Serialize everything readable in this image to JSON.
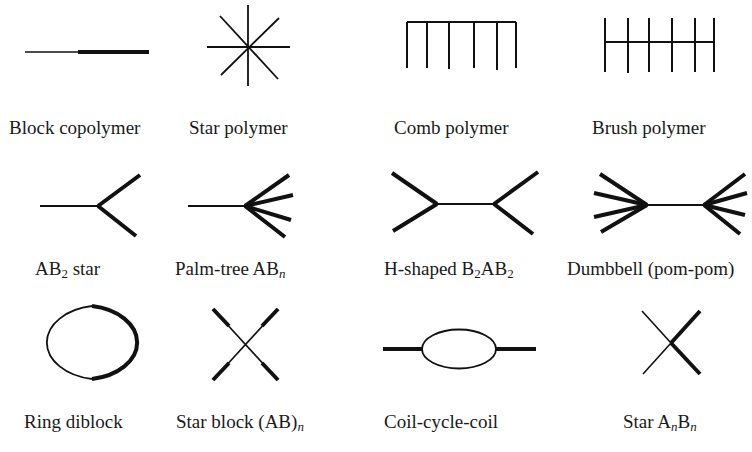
{
  "diagram": {
    "colors": {
      "stroke": "#111111",
      "background": "#ffffff"
    },
    "items": [
      {
        "id": "block-copolymer",
        "label": "Block copolymer",
        "row": 1,
        "col": 1
      },
      {
        "id": "star-polymer",
        "label": "Star polymer",
        "row": 1,
        "col": 2
      },
      {
        "id": "comb-polymer",
        "label": "Comb polymer",
        "row": 1,
        "col": 3
      },
      {
        "id": "brush-polymer",
        "label": "Brush polymer",
        "row": 1,
        "col": 4
      },
      {
        "id": "ab2-star",
        "label_main": "AB",
        "label_sub": "2",
        "label_tail": " star",
        "row": 2,
        "col": 1
      },
      {
        "id": "palm-tree",
        "label_main": "Palm-tree AB",
        "label_sub": "n",
        "row": 2,
        "col": 2
      },
      {
        "id": "h-shaped",
        "label_main": "H-shaped B",
        "label_sub": "2",
        "label_mid": "AB",
        "label_sub2": "2",
        "row": 2,
        "col": 3
      },
      {
        "id": "dumbbell",
        "label": "Dumbbell (pom-pom)",
        "row": 2,
        "col": 4
      },
      {
        "id": "ring-diblock",
        "label": "Ring diblock",
        "row": 3,
        "col": 1
      },
      {
        "id": "star-block",
        "label_main": "Star block (AB)",
        "label_sub": "n",
        "row": 3,
        "col": 2
      },
      {
        "id": "coil-cycle-coil",
        "label": "Coil-cycle-coil",
        "row": 3,
        "col": 3
      },
      {
        "id": "star-anbn",
        "label_main": "Star A",
        "label_sub": "n",
        "label_mid": "B",
        "label_sub2": "n",
        "row": 3,
        "col": 4
      }
    ]
  }
}
